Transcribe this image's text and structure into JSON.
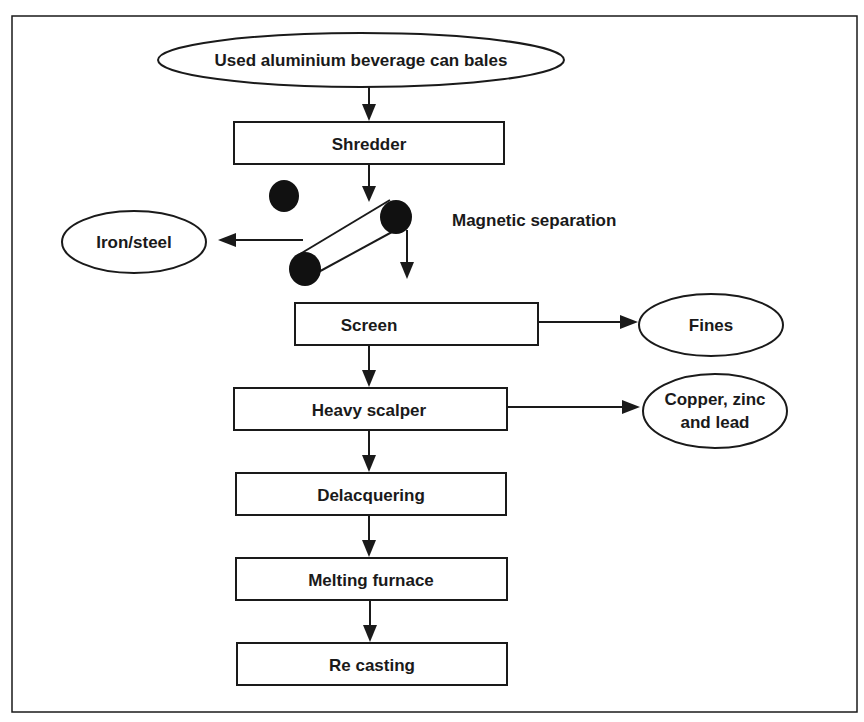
{
  "diagram": {
    "type": "process-flowchart",
    "nodes": {
      "input": {
        "label": "Used aluminium beverage can bales",
        "shape": "ellipse"
      },
      "shredder": {
        "label": "Shredder",
        "shape": "rectangle"
      },
      "magnetic": {
        "label": "Magnetic separation",
        "shape": "conveyor-magnet"
      },
      "iron": {
        "label": "Iron/steel",
        "shape": "ellipse"
      },
      "screen": {
        "label": "Screen",
        "shape": "rectangle"
      },
      "fines": {
        "label": "Fines",
        "shape": "ellipse"
      },
      "scalper": {
        "label": "Heavy scalper",
        "shape": "rectangle"
      },
      "copper_l1": {
        "label": "Copper, zinc",
        "shape": "ellipse"
      },
      "copper_l2": {
        "label": "and lead",
        "shape": "ellipse"
      },
      "delacquering": {
        "label": "Delacquering",
        "shape": "rectangle"
      },
      "furnace": {
        "label": "Melting furnace",
        "shape": "rectangle"
      },
      "recasting": {
        "label": "Re casting",
        "shape": "rectangle"
      }
    },
    "edges": [
      {
        "from": "Used aluminium beverage can bales",
        "to": "Shredder"
      },
      {
        "from": "Shredder",
        "to": "Magnetic separation"
      },
      {
        "from": "Magnetic separation",
        "to": "Iron/steel"
      },
      {
        "from": "Magnetic separation",
        "to": "Screen"
      },
      {
        "from": "Screen",
        "to": "Fines"
      },
      {
        "from": "Screen",
        "to": "Heavy scalper"
      },
      {
        "from": "Heavy scalper",
        "to": "Copper, zinc and lead"
      },
      {
        "from": "Heavy scalper",
        "to": "Delacquering"
      },
      {
        "from": "Delacquering",
        "to": "Melting furnace"
      },
      {
        "from": "Melting furnace",
        "to": "Re casting"
      }
    ],
    "colors": {
      "stroke": "#1a1a1a",
      "fill": "#ffffff"
    }
  }
}
